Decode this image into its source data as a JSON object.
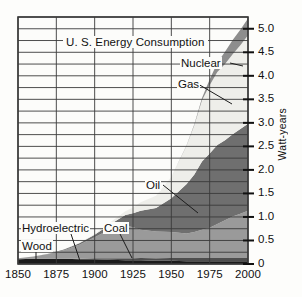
{
  "chart_data": {
    "type": "area",
    "title": "U. S. Energy Consumption",
    "xlabel": "",
    "ylabel": "Watt-years",
    "xlim": [
      1850,
      2000
    ],
    "ylim": [
      0,
      5.25
    ],
    "x_ticks": [
      "1850",
      "1875",
      "1900",
      "1925",
      "1950",
      "1975",
      "2000"
    ],
    "y_ticks": [
      "0",
      "0.5",
      "1.0",
      "1.5",
      "2.0",
      "2.5",
      "3.0",
      "3.5",
      "4.0",
      "4.5",
      "5.0"
    ],
    "grid": "both",
    "grid_minor_y_step": 0.25,
    "legend": "inline-annotations",
    "stacked": true,
    "x": [
      1850,
      1860,
      1870,
      1880,
      1890,
      1900,
      1910,
      1920,
      1925,
      1930,
      1940,
      1950,
      1960,
      1965,
      1970,
      1975,
      1980,
      1985,
      1990,
      1995,
      2000
    ],
    "series": [
      {
        "name": "Wood",
        "color": "#1b1b1b",
        "values": [
          0.1,
          0.11,
          0.11,
          0.11,
          0.1,
          0.1,
          0.09,
          0.08,
          0.08,
          0.08,
          0.07,
          0.07,
          0.06,
          0.06,
          0.06,
          0.06,
          0.06,
          0.06,
          0.06,
          0.06,
          0.06
        ]
      },
      {
        "name": "Hydroelectric",
        "color": "#4d4d4d",
        "values": [
          0.0,
          0.0,
          0.0,
          0.0,
          0.01,
          0.02,
          0.03,
          0.04,
          0.04,
          0.05,
          0.05,
          0.06,
          0.07,
          0.07,
          0.07,
          0.07,
          0.07,
          0.07,
          0.07,
          0.07,
          0.07
        ]
      },
      {
        "name": "Coal",
        "color": "#9a9a9a",
        "values": [
          0.02,
          0.05,
          0.1,
          0.18,
          0.3,
          0.45,
          0.62,
          0.7,
          0.66,
          0.6,
          0.57,
          0.55,
          0.52,
          0.55,
          0.6,
          0.64,
          0.72,
          0.8,
          0.88,
          0.94,
          1.0
        ]
      },
      {
        "name": "Oil",
        "color": "#6f6f6f",
        "values": [
          0.0,
          0.0,
          0.01,
          0.02,
          0.03,
          0.05,
          0.1,
          0.22,
          0.3,
          0.4,
          0.5,
          0.72,
          1.05,
          1.22,
          1.45,
          1.58,
          1.68,
          1.7,
          1.75,
          1.8,
          1.85
        ]
      },
      {
        "name": "Gas",
        "color": "#eeeeea",
        "values": [
          0.0,
          0.0,
          0.0,
          0.0,
          0.01,
          0.02,
          0.04,
          0.08,
          0.12,
          0.18,
          0.26,
          0.45,
          0.82,
          1.05,
          1.3,
          1.45,
          1.55,
          1.62,
          1.7,
          1.78,
          1.88
        ]
      },
      {
        "name": "Nuclear",
        "color": "#8d8d8d",
        "values": [
          0.0,
          0.0,
          0.0,
          0.0,
          0.0,
          0.0,
          0.0,
          0.0,
          0.0,
          0.0,
          0.0,
          0.0,
          0.01,
          0.02,
          0.05,
          0.12,
          0.2,
          0.26,
          0.3,
          0.33,
          0.36
        ]
      }
    ],
    "annotations": [
      {
        "text": "Nuclear",
        "x": 1962,
        "y": 4.22
      },
      {
        "text": "Gas",
        "x": 1962,
        "y": 3.78
      },
      {
        "text": "Oil",
        "x": 1932,
        "y": 1.85
      },
      {
        "text": "Hydroelectric",
        "x": 1857,
        "y": 0.72
      },
      {
        "text": "Coal",
        "x": 1908,
        "y": 0.72
      },
      {
        "text": "Wood",
        "x": 1855,
        "y": 0.4
      }
    ]
  },
  "axis": {
    "y_title": "Watt-years"
  }
}
